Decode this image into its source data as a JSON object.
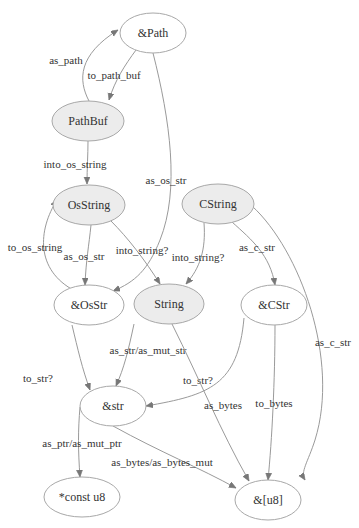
{
  "diagram": {
    "nodes": [
      {
        "id": "path_ref",
        "label": "&Path",
        "filled": false
      },
      {
        "id": "pathbuf",
        "label": "PathBuf",
        "filled": true
      },
      {
        "id": "osstring",
        "label": "OsString",
        "filled": true
      },
      {
        "id": "cstring",
        "label": "CString",
        "filled": true
      },
      {
        "id": "osstr_ref",
        "label": "&OsStr",
        "filled": false
      },
      {
        "id": "string",
        "label": "String",
        "filled": true
      },
      {
        "id": "cstr_ref",
        "label": "&CStr",
        "filled": false
      },
      {
        "id": "str_ref",
        "label": "&str",
        "filled": false
      },
      {
        "id": "const_u8",
        "label": "*const u8",
        "filled": false
      },
      {
        "id": "u8_slice",
        "label": "&[u8]",
        "filled": false
      }
    ],
    "edges": [
      {
        "id": "e0",
        "from": "path_ref",
        "to": "pathbuf",
        "label": "to_path_buf"
      },
      {
        "id": "e1",
        "from": "pathbuf",
        "to": "path_ref",
        "label": "as_path"
      },
      {
        "id": "e2",
        "from": "pathbuf",
        "to": "osstring",
        "label": "into_os_string"
      },
      {
        "id": "e3",
        "from": "path_ref",
        "to": "osstr_ref",
        "label": "as_os_str"
      },
      {
        "id": "e4",
        "from": "osstring",
        "to": "osstr_ref",
        "label": "as_os_str"
      },
      {
        "id": "e5",
        "from": "osstr_ref",
        "to": "osstring",
        "label": "to_os_string"
      },
      {
        "id": "e6",
        "from": "osstring",
        "to": "string",
        "label": "into_string?"
      },
      {
        "id": "e7",
        "from": "cstring",
        "to": "string",
        "label": "into_string?"
      },
      {
        "id": "e8",
        "from": "cstring",
        "to": "cstr_ref",
        "label": "as_c_str"
      },
      {
        "id": "e9",
        "from": "cstring",
        "to": "u8_slice",
        "label": "as_c_str"
      },
      {
        "id": "e10",
        "from": "osstr_ref",
        "to": "str_ref",
        "label": "to_str?"
      },
      {
        "id": "e11",
        "from": "string",
        "to": "str_ref",
        "label": "as_str/as_mut_str"
      },
      {
        "id": "e12",
        "from": "cstr_ref",
        "to": "str_ref",
        "label": "to_str?"
      },
      {
        "id": "e13",
        "from": "string",
        "to": "u8_slice",
        "label": "as_bytes"
      },
      {
        "id": "e14",
        "from": "cstr_ref",
        "to": "u8_slice",
        "label": "to_bytes"
      },
      {
        "id": "e15",
        "from": "str_ref",
        "to": "const_u8",
        "label": "as_ptr/as_mut_ptr"
      },
      {
        "id": "e16",
        "from": "str_ref",
        "to": "u8_slice",
        "label": "as_bytes/as_bytes_mut"
      }
    ]
  }
}
